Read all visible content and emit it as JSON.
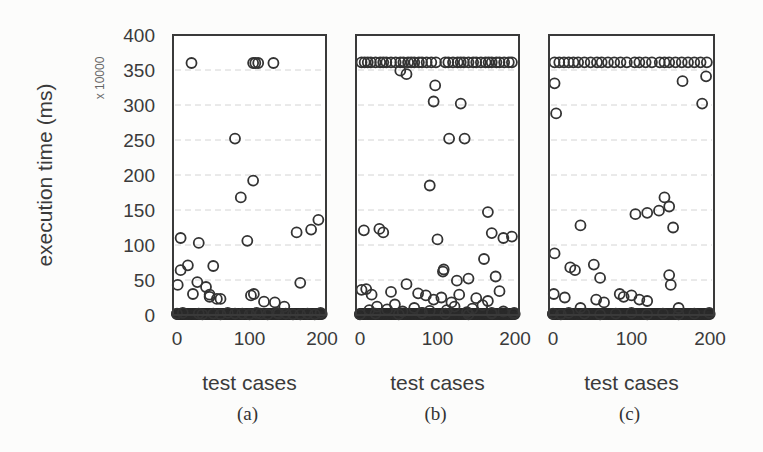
{
  "chart_data": {
    "type": "scatter",
    "layout": "3 side-by-side panels sharing y-axis",
    "ylabel": "execution time (ms)",
    "y_multiplier": "x 10000",
    "ylim": [
      0,
      400
    ],
    "yticks": [
      "0",
      "50",
      "100",
      "150",
      "200",
      "250",
      "300",
      "350",
      "400"
    ],
    "grid": "horizontal dashed light gray",
    "marker": "open circle",
    "panels": [
      {
        "caption": "(a)",
        "xlabel": "test cases",
        "xlim": [
          0,
          200
        ],
        "xticks": [
          "0",
          "100",
          "200"
        ],
        "x": [
          20,
          105,
          108,
          112,
          133,
          80,
          88,
          97,
          105,
          165,
          185,
          195,
          5,
          30,
          5,
          15,
          28,
          50,
          1,
          40,
          22,
          60,
          55,
          45,
          45,
          102,
          106,
          120,
          135,
          148,
          170,
          0,
          8,
          30,
          35,
          50,
          60,
          70,
          80,
          90,
          100,
          110,
          115,
          125,
          138,
          140,
          150,
          160,
          170,
          180,
          190,
          198
        ],
        "y": [
          360,
          360,
          360,
          360,
          360,
          252,
          168,
          106,
          192,
          118,
          122,
          136,
          110,
          103,
          64,
          71,
          47,
          70,
          43,
          40,
          30,
          23,
          23,
          26,
          29,
          28,
          30,
          19,
          18,
          12,
          46,
          2,
          3,
          2,
          1,
          2,
          1,
          3,
          2,
          2,
          1,
          3,
          2,
          1,
          3,
          2,
          2,
          1,
          1,
          2,
          1,
          3
        ]
      },
      {
        "caption": "(b)",
        "xlabel": "test cases",
        "xlim": [
          0,
          200
        ],
        "xticks": [
          "0",
          "100",
          "200"
        ],
        "x": [
          2,
          6,
          10,
          14,
          20,
          26,
          30,
          34,
          40,
          46,
          52,
          56,
          62,
          66,
          70,
          76,
          80,
          86,
          92,
          98,
          110,
          114,
          120,
          126,
          130,
          134,
          140,
          146,
          150,
          156,
          162,
          166,
          170,
          176,
          180,
          186,
          192,
          196,
          52,
          60,
          97,
          95,
          130,
          115,
          135,
          90,
          165,
          170,
          185,
          196,
          5,
          25,
          30,
          100,
          107,
          108,
          125,
          140,
          160,
          175,
          2,
          8,
          15,
          40,
          60,
          75,
          85,
          95,
          105,
          118,
          128,
          150,
          165,
          180,
          12,
          22,
          35,
          45,
          55,
          70,
          80,
          90,
          112,
          122,
          138,
          145,
          158,
          170,
          185,
          198,
          0,
          20,
          50,
          80,
          110,
          140,
          170,
          199
        ],
        "y": [
          361,
          361,
          361,
          361,
          361,
          361,
          361,
          361,
          361,
          361,
          361,
          361,
          361,
          361,
          361,
          361,
          361,
          361,
          361,
          361,
          361,
          361,
          361,
          361,
          361,
          361,
          361,
          361,
          361,
          361,
          361,
          361,
          361,
          361,
          361,
          361,
          361,
          361,
          349,
          344,
          328,
          305,
          302,
          252,
          252,
          185,
          147,
          117,
          110,
          112,
          121,
          123,
          118,
          108,
          62,
          65,
          49,
          52,
          80,
          55,
          36,
          37,
          29,
          33,
          44,
          31,
          28,
          22,
          25,
          18,
          29,
          24,
          20,
          34,
          7,
          12,
          8,
          15,
          5,
          10,
          3,
          6,
          7,
          12,
          4,
          9,
          14,
          3,
          5,
          2,
          1,
          2,
          1,
          3,
          2,
          1,
          2,
          3
        ]
      },
      {
        "caption": "(c)",
        "xlabel": "test cases",
        "xlim": [
          0,
          200
        ],
        "xticks": [
          "0",
          "100",
          "200"
        ],
        "x": [
          2,
          8,
          14,
          20,
          26,
          32,
          40,
          48,
          56,
          62,
          70,
          78,
          86,
          94,
          104,
          110,
          118,
          126,
          136,
          142,
          148,
          156,
          164,
          172,
          180,
          188,
          196,
          2,
          4,
          165,
          190,
          195,
          105,
          135,
          148,
          153,
          142,
          35,
          120,
          2,
          22,
          28,
          52,
          60,
          148,
          150,
          1,
          15,
          35,
          55,
          65,
          85,
          90,
          100,
          110,
          120,
          160,
          0,
          10,
          20,
          40,
          60,
          80,
          100,
          120,
          140,
          160,
          180,
          199
        ],
        "y": [
          361,
          361,
          361,
          361,
          361,
          361,
          361,
          361,
          361,
          361,
          361,
          361,
          361,
          361,
          361,
          361,
          361,
          361,
          361,
          361,
          361,
          361,
          361,
          361,
          361,
          361,
          361,
          331,
          288,
          334,
          302,
          341,
          144,
          149,
          155,
          125,
          168,
          128,
          146,
          88,
          68,
          64,
          72,
          53,
          57,
          43,
          30,
          25,
          10,
          22,
          18,
          30,
          26,
          28,
          22,
          20,
          10,
          2,
          1,
          3,
          2,
          1,
          2,
          3,
          1,
          2,
          1,
          2,
          3
        ]
      }
    ]
  },
  "yaxis": {
    "title": "execution time (ms)",
    "multiplier": "x 10000",
    "ticks": [
      "0",
      "50",
      "100",
      "150",
      "200",
      "250",
      "300",
      "350",
      "400"
    ]
  },
  "panels": [
    {
      "caption": "(a)",
      "xlabel": "test cases",
      "xticks": [
        "0",
        "100",
        "200"
      ]
    },
    {
      "caption": "(b)",
      "xlabel": "test cases",
      "xticks": [
        "0",
        "100",
        "200"
      ]
    },
    {
      "caption": "(c)",
      "xlabel": "test cases",
      "xticks": [
        "0",
        "100",
        "200"
      ]
    }
  ]
}
